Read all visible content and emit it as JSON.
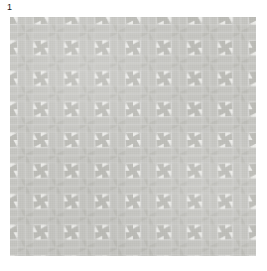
{
  "figure": {
    "label": "1",
    "alt_name": "fabric-swatch"
  },
  "canvas": {
    "width": 267,
    "height": 271,
    "background": "#ffffff"
  },
  "swatch": {
    "x": 10,
    "y": 17,
    "width": 246,
    "height": 239,
    "pattern_name": "houndstooth-pinwheel-plaid",
    "tile_size": 30.75,
    "columns": 8,
    "rows": 7.77
  },
  "palette": {
    "background": "#ffffff",
    "cloth_light": "#f3f3f1",
    "cloth_pale": "#e4e4e1",
    "cloth_mid": "#cfcfcb",
    "cloth_grey": "#c4c4c0",
    "cloth_dark": "#b8b8b3",
    "label_text": "#1a1a1a"
  }
}
